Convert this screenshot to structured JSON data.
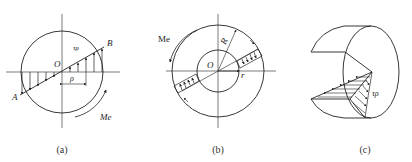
{
  "figures": [
    {
      "id": "a",
      "caption": "(a)",
      "description": "Solid circular shaft cross-section with linear shear stress distribution along diameter AB",
      "labels": {
        "origin": "O",
        "stress": "τρ",
        "point_b": "B",
        "point_a": "A",
        "radius": "ρ",
        "torque": "Me"
      }
    },
    {
      "id": "b",
      "caption": "(b)",
      "description": "Hollow circular shaft cross-section with shear stress distribution between inner and outer radius",
      "labels": {
        "torque": "Me",
        "outer_radius": "R",
        "origin": "O",
        "inner_radius": "r"
      }
    },
    {
      "id": "c",
      "caption": "(c)",
      "description": "3D cutaway of shaft segment showing shear stress distribution on cut planes",
      "labels": {
        "stress": "τρ"
      }
    }
  ],
  "colors": {
    "stroke": "#222222",
    "background": "#ffffff"
  }
}
